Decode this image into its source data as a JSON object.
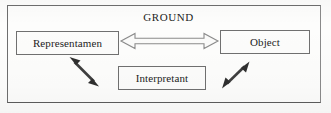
{
  "diagram": {
    "title": "GROUND",
    "frame": {
      "name": "outer-border"
    },
    "nodes": [
      {
        "id": "representamen",
        "label": "Representamen"
      },
      {
        "id": "object",
        "label": "Object"
      },
      {
        "id": "interpretant",
        "label": "Interpretant"
      }
    ],
    "connectors": [
      {
        "id": "representamen-object",
        "style": "hollow-double-headed-arrow",
        "orientation": "horizontal",
        "from": "representamen",
        "to": "object"
      },
      {
        "id": "representamen-interpretant",
        "style": "solid-double-headed-arrow",
        "orientation": "diagonal-down-right",
        "from": "representamen",
        "to": "interpretant"
      },
      {
        "id": "interpretant-object",
        "style": "solid-double-headed-arrow",
        "orientation": "diagonal-up-right",
        "from": "interpretant",
        "to": "object"
      }
    ],
    "colors": {
      "background": "#fdfdfc",
      "stroke": "#707070",
      "text": "#1d1d1d",
      "arrow_outline": "#8b8b8b",
      "arrow_solid": "#3a3a3a"
    }
  }
}
